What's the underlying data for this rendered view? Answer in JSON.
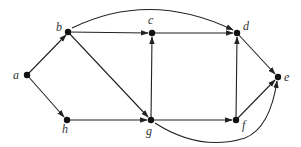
{
  "diagram": {
    "type": "directed-graph",
    "colors": {
      "stroke": "#222222",
      "node": "#111111",
      "label": "#333333",
      "background": "#ffffff"
    },
    "nodes": [
      {
        "id": "a",
        "label": "a",
        "x": 27,
        "y": 75,
        "lx": 13,
        "ly": 79
      },
      {
        "id": "b",
        "label": "b",
        "x": 68,
        "y": 32,
        "lx": 56,
        "ly": 31
      },
      {
        "id": "c",
        "label": "c",
        "x": 152,
        "y": 33,
        "lx": 148,
        "ly": 24
      },
      {
        "id": "d",
        "label": "d",
        "x": 237,
        "y": 33,
        "lx": 243,
        "ly": 30
      },
      {
        "id": "e",
        "label": "e",
        "x": 278,
        "y": 77,
        "lx": 284,
        "ly": 81
      },
      {
        "id": "f",
        "label": "f",
        "x": 236,
        "y": 120,
        "lx": 242,
        "ly": 129
      },
      {
        "id": "g",
        "label": "g",
        "x": 151,
        "y": 120,
        "lx": 146,
        "ly": 135
      },
      {
        "id": "h",
        "label": "h",
        "x": 67,
        "y": 120,
        "lx": 62,
        "ly": 133
      }
    ],
    "edges": [
      {
        "from": "a",
        "to": "b",
        "path": "M27,75 L66,35"
      },
      {
        "from": "a",
        "to": "h",
        "path": "M27,75 L64,117"
      },
      {
        "from": "b",
        "to": "c",
        "path": "M68,32 L148,33"
      },
      {
        "from": "b",
        "to": "g",
        "path": "M68,32 L148,117"
      },
      {
        "from": "b",
        "to": "d",
        "path": "M72,28 Q150,-10 233,30"
      },
      {
        "from": "c",
        "to": "d",
        "path": "M152,33 L233,33"
      },
      {
        "from": "g",
        "to": "c",
        "path": "M151,120 L152,37"
      },
      {
        "from": "h",
        "to": "g",
        "path": "M67,120 L147,120"
      },
      {
        "from": "g",
        "to": "f",
        "path": "M151,120 L232,120"
      },
      {
        "from": "f",
        "to": "d",
        "path": "M236,120 L237,37"
      },
      {
        "from": "d",
        "to": "e",
        "path": "M237,33 L275,74"
      },
      {
        "from": "f",
        "to": "e",
        "path": "M236,120 L275,80"
      },
      {
        "from": "g",
        "to": "e",
        "path": "M155,123 Q200,152 245,138 Q270,128 277,81"
      }
    ]
  }
}
